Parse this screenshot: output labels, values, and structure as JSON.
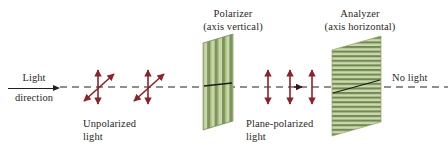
{
  "figure": {
    "background_color": "#ffffff",
    "axis": {
      "name": "optical-axis",
      "style": "dashed",
      "color": "#6f6a68",
      "y": 87
    },
    "colors": {
      "arrow_red": "#8f2128",
      "filter_green_light": "#c2d1a4",
      "filter_green_dark": "#6f8a4a",
      "filter_edge": "#5d7a3c",
      "text": "#2b2725",
      "dash": "#6f6a68"
    },
    "labels": {
      "polarizer_line1": "Polarizer",
      "polarizer_line2": "(axis vertical)",
      "analyzer_line1": "Analyzer",
      "analyzer_line2": "(axis horizontal)",
      "light_direction_line1": "Light",
      "light_direction_line2": "direction",
      "unpolarized_line1": "Unpolarized",
      "unpolarized_line2": "light",
      "plane_polarized_line1": "Plane-polarized",
      "plane_polarized_line2": "light",
      "no_light": "No light"
    },
    "elements": {
      "unpolarized_arrows": {
        "name": "unpolarized-light-arrows",
        "count": 2,
        "description": "crossed vertical and diagonal double-headed arrows",
        "x_positions": [
          98,
          148
        ]
      },
      "plane_polarized_arrows": {
        "name": "plane-polarized-light-arrows",
        "count": 3,
        "description": "vertical double-headed arrows",
        "x_positions": [
          268,
          290,
          312
        ]
      },
      "propagation_arrowhead": {
        "name": "propagation-arrowhead",
        "x": 299,
        "y": 87
      },
      "polarizer_filter": {
        "name": "polarizer-filter",
        "stripe_orientation": "vertical",
        "stripe_count": 11
      },
      "analyzer_filter": {
        "name": "analyzer-filter",
        "stripe_orientation": "horizontal",
        "stripe_count": 22
      }
    }
  }
}
